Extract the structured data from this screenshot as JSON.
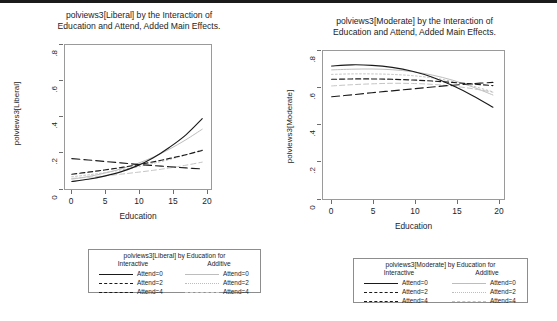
{
  "figure": {
    "background": "#ffffff",
    "ink_dark": "#1a1a1a",
    "ink_light": "#bdbdbd"
  },
  "panels": [
    {
      "id": "liberal",
      "title": "polviews3[Liberal] by the Interaction of\nEducation and Attend, Added Main Effects.",
      "xlabel": "Education",
      "ylabel": "polviews3[Liberal]",
      "xticks": [
        "0",
        "5",
        "10",
        "15",
        "20"
      ],
      "yticks": [
        ".8",
        ".6",
        ".4",
        ".2",
        "0"
      ],
      "legend": {
        "title": "polviews3[Liberal] by Education for",
        "col_left": "Interactive",
        "col_right": "Additive",
        "rows_left": [
          "Attend=0",
          "Attend=2",
          "Attend=4"
        ],
        "rows_right": [
          "Attend=0",
          "Attend=2",
          "Attend=4"
        ]
      }
    },
    {
      "id": "moderate",
      "title": "polviews3[Moderate] by the Interaction of\nEducation and Attend, Added Main Effects.",
      "xlabel": "Education",
      "ylabel": "polviews3[Moderate]",
      "xticks": [
        "0",
        "5",
        "10",
        "15",
        "20"
      ],
      "yticks": [
        ".8",
        ".6",
        ".4",
        ".2",
        "0"
      ],
      "legend": {
        "title": "polviews3[Moderate] by Education for",
        "col_left": "Interactive",
        "col_right": "Additive",
        "rows_left": [
          "Attend=0",
          "Attend=2",
          "Attend=4"
        ],
        "rows_right": [
          "Attend=0",
          "Attend=2",
          "Attend=4"
        ]
      }
    }
  ],
  "chart_data": [
    {
      "type": "line",
      "id": "liberal",
      "title": "polviews3[Liberal] by the Interaction of Education and Attend, Added Main Effects.",
      "xlabel": "Education",
      "ylabel": "polviews3[Liberal]",
      "xlim": [
        -1.2,
        21.5
      ],
      "ylim": [
        -0.02,
        0.84
      ],
      "xticks": [
        0,
        5,
        10,
        15,
        20
      ],
      "yticks": [
        0,
        0.2,
        0.4,
        0.6,
        0.8
      ],
      "grid": false,
      "legend_position": "below-figure",
      "x": [
        0,
        2.5,
        5,
        7.5,
        10,
        12.5,
        15,
        17.5,
        20
      ],
      "series": [
        {
          "name": "Interactive Attend=0",
          "style": "solid",
          "color": "#1a1a1a",
          "values": [
            0.03,
            0.043,
            0.062,
            0.087,
            0.122,
            0.17,
            0.232,
            0.305,
            0.4
          ]
        },
        {
          "name": "Interactive Attend=2",
          "style": "dashed",
          "color": "#1a1a1a",
          "values": [
            0.073,
            0.085,
            0.098,
            0.112,
            0.128,
            0.146,
            0.166,
            0.188,
            0.213
          ]
        },
        {
          "name": "Interactive Attend=4",
          "style": "long-dash",
          "color": "#1a1a1a",
          "values": [
            0.165,
            0.157,
            0.148,
            0.14,
            0.131,
            0.124,
            0.117,
            0.11,
            0.104
          ]
        },
        {
          "name": "Additive Attend=0",
          "style": "solid",
          "color": "#bdbdbd",
          "values": [
            0.044,
            0.059,
            0.079,
            0.104,
            0.135,
            0.174,
            0.221,
            0.276,
            0.338
          ]
        },
        {
          "name": "Additive Attend=2",
          "style": "dotted",
          "color": "#bdbdbd",
          "values": [
            0.058,
            0.069,
            0.082,
            0.098,
            0.116,
            0.137,
            0.16,
            0.187,
            0.216
          ]
        },
        {
          "name": "Additive Attend=4",
          "style": "dashed",
          "color": "#c4c4c4",
          "values": [
            0.048,
            0.055,
            0.063,
            0.073,
            0.084,
            0.096,
            0.11,
            0.126,
            0.144
          ]
        }
      ]
    },
    {
      "type": "line",
      "id": "moderate",
      "title": "polviews3[Moderate] by the Interaction of Education and Attend, Added Main Effects.",
      "xlabel": "Education",
      "ylabel": "polviews3[Moderate]",
      "xlim": [
        -1.2,
        21.5
      ],
      "ylim": [
        -0.02,
        0.84
      ],
      "xticks": [
        0,
        5,
        10,
        15,
        20
      ],
      "yticks": [
        0,
        0.2,
        0.4,
        0.6,
        0.8
      ],
      "grid": false,
      "legend_position": "below-figure",
      "x": [
        0,
        2.5,
        5,
        7.5,
        10,
        12.5,
        15,
        17.5,
        20
      ],
      "series": [
        {
          "name": "Interactive Attend=0",
          "style": "solid",
          "color": "#1a1a1a",
          "values": [
            0.748,
            0.755,
            0.752,
            0.74,
            0.718,
            0.684,
            0.636,
            0.578,
            0.512
          ]
        },
        {
          "name": "Interactive Attend=2",
          "style": "dashed",
          "color": "#1a1a1a",
          "values": [
            0.672,
            0.674,
            0.674,
            0.672,
            0.668,
            0.662,
            0.654,
            0.645,
            0.636
          ]
        },
        {
          "name": "Interactive Attend=4",
          "style": "long-dash",
          "color": "#1a1a1a",
          "values": [
            0.572,
            0.583,
            0.595,
            0.606,
            0.617,
            0.628,
            0.638,
            0.647,
            0.654
          ]
        },
        {
          "name": "Additive Attend=0",
          "style": "solid",
          "color": "#bdbdbd",
          "values": [
            0.726,
            0.73,
            0.731,
            0.727,
            0.716,
            0.696,
            0.667,
            0.628,
            0.582
          ]
        },
        {
          "name": "Additive Attend=2",
          "style": "dotted",
          "color": "#bdbdbd",
          "values": [
            0.7,
            0.703,
            0.703,
            0.7,
            0.693,
            0.68,
            0.66,
            0.633,
            0.6
          ]
        },
        {
          "name": "Additive Attend=4",
          "style": "dashed",
          "color": "#c4c4c4",
          "values": [
            0.634,
            0.641,
            0.646,
            0.649,
            0.648,
            0.643,
            0.633,
            0.618,
            0.598
          ]
        }
      ]
    }
  ]
}
